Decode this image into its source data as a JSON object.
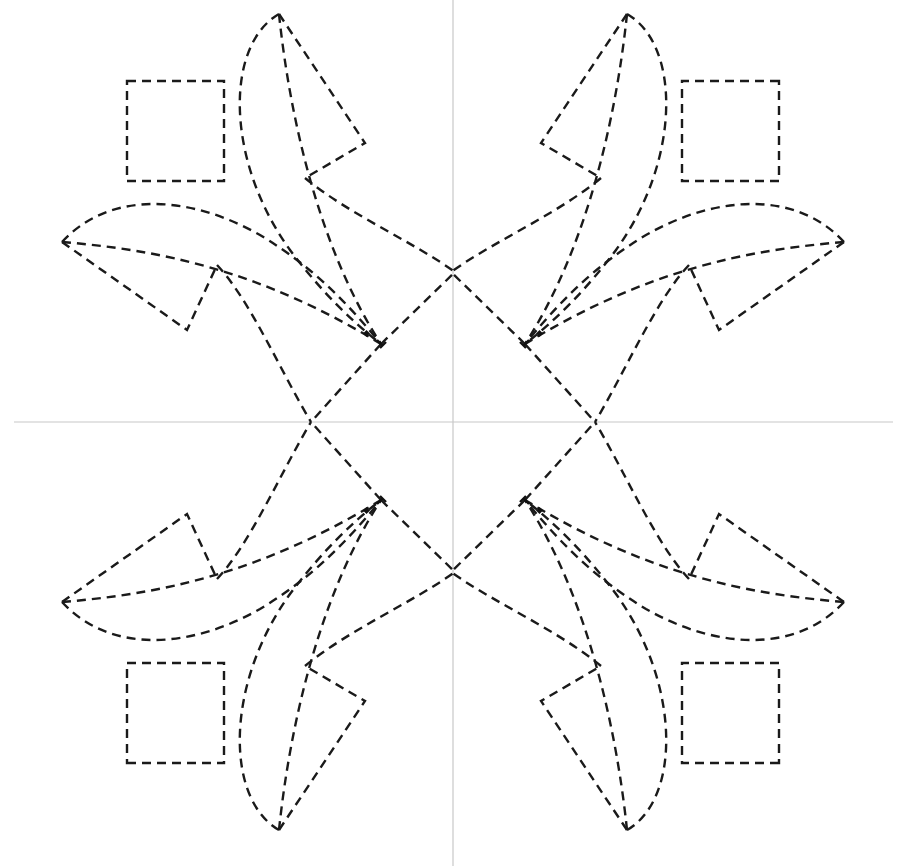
{
  "diagram": {
    "type": "geometric-pattern",
    "symmetry": "mirror about vertical and horizontal center axes",
    "canvas": {
      "width": 898,
      "height": 866
    },
    "center": {
      "x": 453,
      "y": 422
    },
    "colors": {
      "stroke": "#1a1a1a",
      "axis": "#c8c8c8",
      "background": "#ffffff"
    },
    "axes": {
      "vertical": {
        "x": 453,
        "y1": 0,
        "y2": 866
      },
      "horizontal": {
        "y": 422,
        "x1": 14,
        "x2": 893
      }
    },
    "quadrant_elements": [
      {
        "name": "square",
        "shape": "rect",
        "x": 127,
        "y": 81,
        "w": 97,
        "h": 100
      },
      {
        "name": "top-spike-outer-arc",
        "shape": "curve",
        "from": [
          279,
          14
        ],
        "to": [
          381,
          344
        ]
      },
      {
        "name": "top-spike-inner-line",
        "shape": "curve",
        "from": [
          279,
          14
        ],
        "to": [
          381,
          344
        ]
      },
      {
        "name": "top-kite",
        "shape": "polyline",
        "points": [
          [
            279,
            14
          ],
          [
            365,
            143
          ],
          [
            305,
            178
          ]
        ]
      },
      {
        "name": "left-spike-outer-arc",
        "shape": "curve",
        "from": [
          62,
          242
        ],
        "to": [
          381,
          344
        ]
      },
      {
        "name": "left-spike-inner-line",
        "shape": "curve",
        "from": [
          62,
          242
        ],
        "to": [
          381,
          344
        ]
      },
      {
        "name": "left-kite",
        "shape": "polyline",
        "points": [
          [
            62,
            242
          ],
          [
            187,
            330
          ],
          [
            217,
            265
          ]
        ]
      },
      {
        "name": "diamond-upper-edge",
        "shape": "curve",
        "from": [
          305,
          178
        ],
        "to": [
          455,
          272
        ]
      },
      {
        "name": "diamond-left-edge",
        "shape": "curve",
        "from": [
          217,
          265
        ],
        "to": [
          311,
          422
        ]
      },
      {
        "name": "center-link",
        "shape": "line",
        "from": [
          381,
          344
        ],
        "to": [
          455,
          272
        ]
      },
      {
        "name": "center-link-2",
        "shape": "line",
        "from": [
          381,
          344
        ],
        "to": [
          311,
          422
        ]
      }
    ],
    "quadrant_count": 4,
    "dot_marker": "small filled square near fan convergence point"
  }
}
